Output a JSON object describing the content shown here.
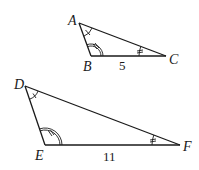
{
  "diagram": {
    "triangles": [
      {
        "name": "ABC",
        "vertices": {
          "A": {
            "label": "A",
            "x": 79,
            "y": 23
          },
          "B": {
            "label": "B",
            "x": 91,
            "y": 56
          },
          "C": {
            "label": "C",
            "x": 166,
            "y": 56
          }
        },
        "side_label": {
          "side": "BC",
          "value": "5"
        },
        "angle_marks": {
          "A": "single-arc-1-tick",
          "B": "double-arc-2-ticks",
          "C": "single-arc-2-ticks"
        }
      },
      {
        "name": "DEF",
        "vertices": {
          "D": {
            "label": "D",
            "x": 25,
            "y": 86
          },
          "E": {
            "label": "E",
            "x": 45,
            "y": 145
          },
          "F": {
            "label": "F",
            "x": 180,
            "y": 145
          }
        },
        "side_label": {
          "side": "EF",
          "value": "11"
        },
        "angle_marks": {
          "D": "single-arc-1-tick",
          "E": "double-arc-2-ticks",
          "F": "single-arc-2-ticks"
        }
      }
    ]
  }
}
